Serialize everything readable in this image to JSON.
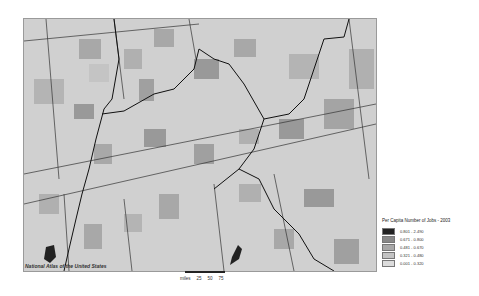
{
  "map": {
    "attribution": "National Atlas of the United States",
    "background_color": "#d6d6d6",
    "region_colors": [
      "#222222",
      "#888888",
      "#a8a8a8",
      "#c4c4c4",
      "#dcdcdc"
    ]
  },
  "legend": {
    "title": "Per Capita Number of Jobs - 2003",
    "items": [
      {
        "label": "0.801 - 2.490",
        "color": "#222222"
      },
      {
        "label": "0.671 - 0.800",
        "color": "#888888"
      },
      {
        "label": "0.481 - 0.670",
        "color": "#a8a8a8"
      },
      {
        "label": "0.321 - 0.480",
        "color": "#c4c4c4"
      },
      {
        "label": "0.001 - 0.320",
        "color": "#dcdcdc"
      }
    ]
  },
  "scale": {
    "unit": "miles",
    "ticks": [
      "25",
      "50",
      "75"
    ]
  }
}
